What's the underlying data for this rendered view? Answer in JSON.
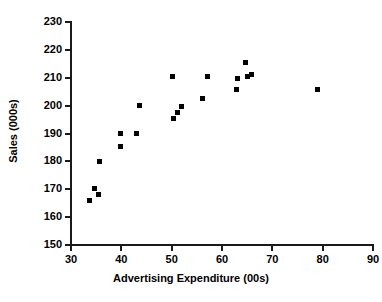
{
  "chart_data": {
    "type": "scatter",
    "title": "",
    "xlabel": "Advertising Expenditure (00s)",
    "ylabel": "Sales (000s)",
    "xlim": [
      30,
      90
    ],
    "ylim": [
      150,
      230
    ],
    "xticks": [
      30,
      40,
      50,
      60,
      70,
      80,
      90
    ],
    "yticks": [
      150,
      160,
      170,
      180,
      190,
      200,
      210,
      220,
      230
    ],
    "grid": false,
    "legend": null,
    "marker_color": "#000000",
    "marker_shape": "square",
    "axis_color": "#1a1a1a",
    "points": [
      {
        "x": 33.6,
        "y": 166.0
      },
      {
        "x": 34.6,
        "y": 170.2
      },
      {
        "x": 35.4,
        "y": 168.0
      },
      {
        "x": 35.6,
        "y": 180.0
      },
      {
        "x": 39.9,
        "y": 190.0
      },
      {
        "x": 39.9,
        "y": 185.4
      },
      {
        "x": 43.1,
        "y": 190.0
      },
      {
        "x": 43.7,
        "y": 200.2
      },
      {
        "x": 50.2,
        "y": 210.4
      },
      {
        "x": 50.3,
        "y": 195.5
      },
      {
        "x": 51.2,
        "y": 197.6
      },
      {
        "x": 52.0,
        "y": 199.7
      },
      {
        "x": 56.1,
        "y": 202.5
      },
      {
        "x": 57.1,
        "y": 210.4
      },
      {
        "x": 62.9,
        "y": 205.8
      },
      {
        "x": 63.1,
        "y": 209.7
      },
      {
        "x": 64.6,
        "y": 215.5
      },
      {
        "x": 65.0,
        "y": 210.3
      },
      {
        "x": 65.8,
        "y": 211.2
      },
      {
        "x": 78.9,
        "y": 205.8
      }
    ]
  }
}
